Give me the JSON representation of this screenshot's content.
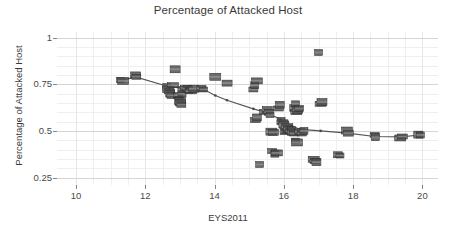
{
  "chart_data": {
    "type": "scatter",
    "title": "Percentage of Attacked Host",
    "xlabel": "EYS2011",
    "ylabel": "Percentage of Attacked Host",
    "xlim": [
      9.45,
      20.45
    ],
    "ylim": [
      0.21,
      1.03
    ],
    "xticks": [
      10,
      12,
      14,
      16,
      18,
      20
    ],
    "xtick_labels": [
      "10",
      "12",
      "14",
      "16",
      "18",
      "20"
    ],
    "yticks": [
      0.25,
      0.5,
      0.75,
      1
    ],
    "ytick_labels": [
      "0.25",
      "0.5",
      "0.75",
      "1"
    ],
    "grid": true,
    "legend": null,
    "marker_color": "#4a4a4a",
    "marker_edge_color": "#2b2b2b",
    "trend_line_color": "#555555",
    "points": [
      {
        "x": 11.28,
        "y": 0.772
      },
      {
        "x": 11.36,
        "y": 0.768
      },
      {
        "x": 11.72,
        "y": 0.8
      },
      {
        "x": 11.74,
        "y": 0.79
      },
      {
        "x": 12.62,
        "y": 0.735
      },
      {
        "x": 12.66,
        "y": 0.722
      },
      {
        "x": 12.7,
        "y": 0.712
      },
      {
        "x": 12.72,
        "y": 0.7
      },
      {
        "x": 12.74,
        "y": 0.69
      },
      {
        "x": 12.8,
        "y": 0.745
      },
      {
        "x": 12.86,
        "y": 0.83
      },
      {
        "x": 12.94,
        "y": 0.69
      },
      {
        "x": 12.98,
        "y": 0.672
      },
      {
        "x": 13.0,
        "y": 0.66
      },
      {
        "x": 13.02,
        "y": 0.65
      },
      {
        "x": 13.04,
        "y": 0.64
      },
      {
        "x": 13.06,
        "y": 0.7
      },
      {
        "x": 13.1,
        "y": 0.722
      },
      {
        "x": 13.16,
        "y": 0.73
      },
      {
        "x": 13.22,
        "y": 0.726
      },
      {
        "x": 13.26,
        "y": 0.718
      },
      {
        "x": 13.32,
        "y": 0.712
      },
      {
        "x": 13.4,
        "y": 0.726
      },
      {
        "x": 13.62,
        "y": 0.728
      },
      {
        "x": 13.68,
        "y": 0.722
      },
      {
        "x": 14.02,
        "y": 0.79
      },
      {
        "x": 14.36,
        "y": 0.756
      },
      {
        "x": 15.12,
        "y": 0.722
      },
      {
        "x": 15.16,
        "y": 0.745
      },
      {
        "x": 15.22,
        "y": 0.768
      },
      {
        "x": 15.18,
        "y": 0.558
      },
      {
        "x": 15.22,
        "y": 0.572
      },
      {
        "x": 15.3,
        "y": 0.32
      },
      {
        "x": 15.46,
        "y": 0.602
      },
      {
        "x": 15.52,
        "y": 0.612
      },
      {
        "x": 15.56,
        "y": 0.6
      },
      {
        "x": 15.6,
        "y": 0.585
      },
      {
        "x": 15.64,
        "y": 0.496
      },
      {
        "x": 15.7,
        "y": 0.492
      },
      {
        "x": 15.66,
        "y": 0.392
      },
      {
        "x": 15.74,
        "y": 0.378
      },
      {
        "x": 15.8,
        "y": 0.382
      },
      {
        "x": 15.84,
        "y": 0.62
      },
      {
        "x": 15.88,
        "y": 0.64
      },
      {
        "x": 15.92,
        "y": 0.556
      },
      {
        "x": 15.96,
        "y": 0.546
      },
      {
        "x": 16.0,
        "y": 0.534
      },
      {
        "x": 16.02,
        "y": 0.496
      },
      {
        "x": 16.06,
        "y": 0.5
      },
      {
        "x": 16.1,
        "y": 0.52
      },
      {
        "x": 16.14,
        "y": 0.51
      },
      {
        "x": 16.18,
        "y": 0.498
      },
      {
        "x": 16.22,
        "y": 0.504
      },
      {
        "x": 16.26,
        "y": 0.492
      },
      {
        "x": 16.3,
        "y": 0.486
      },
      {
        "x": 16.3,
        "y": 0.622
      },
      {
        "x": 16.34,
        "y": 0.645
      },
      {
        "x": 16.36,
        "y": 0.6
      },
      {
        "x": 16.4,
        "y": 0.612
      },
      {
        "x": 16.44,
        "y": 0.62
      },
      {
        "x": 16.34,
        "y": 0.448
      },
      {
        "x": 16.38,
        "y": 0.438
      },
      {
        "x": 16.46,
        "y": 0.496
      },
      {
        "x": 16.52,
        "y": 0.486
      },
      {
        "x": 16.58,
        "y": 0.5
      },
      {
        "x": 16.86,
        "y": 0.348
      },
      {
        "x": 16.9,
        "y": 0.338
      },
      {
        "x": 16.94,
        "y": 0.332
      },
      {
        "x": 17.0,
        "y": 0.92
      },
      {
        "x": 17.06,
        "y": 0.645
      },
      {
        "x": 17.1,
        "y": 0.655
      },
      {
        "x": 17.56,
        "y": 0.372
      },
      {
        "x": 17.62,
        "y": 0.368
      },
      {
        "x": 17.82,
        "y": 0.502
      },
      {
        "x": 17.86,
        "y": 0.488
      },
      {
        "x": 18.62,
        "y": 0.478
      },
      {
        "x": 18.64,
        "y": 0.466
      },
      {
        "x": 19.36,
        "y": 0.462
      },
      {
        "x": 19.42,
        "y": 0.47
      },
      {
        "x": 19.88,
        "y": 0.48
      },
      {
        "x": 19.94,
        "y": 0.478
      }
    ],
    "trend_line": [
      {
        "x": 11.3,
        "y": 0.772
      },
      {
        "x": 11.74,
        "y": 0.788
      },
      {
        "x": 12.66,
        "y": 0.738
      },
      {
        "x": 13.1,
        "y": 0.728
      },
      {
        "x": 13.4,
        "y": 0.726
      },
      {
        "x": 13.66,
        "y": 0.724
      },
      {
        "x": 14.02,
        "y": 0.69
      },
      {
        "x": 14.36,
        "y": 0.664
      },
      {
        "x": 15.12,
        "y": 0.618
      },
      {
        "x": 15.52,
        "y": 0.596
      },
      {
        "x": 15.9,
        "y": 0.562
      },
      {
        "x": 16.22,
        "y": 0.528
      },
      {
        "x": 16.48,
        "y": 0.508
      },
      {
        "x": 17.06,
        "y": 0.5
      },
      {
        "x": 17.84,
        "y": 0.488
      },
      {
        "x": 18.62,
        "y": 0.47
      },
      {
        "x": 19.4,
        "y": 0.468
      },
      {
        "x": 19.92,
        "y": 0.478
      }
    ]
  }
}
